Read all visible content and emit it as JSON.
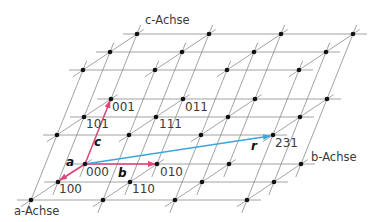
{
  "diagram": {
    "type": "crystal-lattice",
    "axes": {
      "a_label": "a-Achse",
      "b_label": "b-Achse",
      "c_label": "c-Achse"
    },
    "vectors": {
      "a": "a",
      "b": "b",
      "c": "c",
      "r": "r"
    },
    "point_labels": [
      {
        "id": "p001",
        "text": "001"
      },
      {
        "id": "p011",
        "text": "011"
      },
      {
        "id": "p101",
        "text": "101"
      },
      {
        "id": "p111",
        "text": "111"
      },
      {
        "id": "p000",
        "text": "000"
      },
      {
        "id": "p010",
        "text": "010"
      },
      {
        "id": "p100",
        "text": "100"
      },
      {
        "id": "p110",
        "text": "110"
      },
      {
        "id": "p231",
        "text": "231"
      }
    ],
    "colors": {
      "grid": "#8a8a8a",
      "point": "#111111",
      "basis_vector": "#e0457b",
      "position_vector": "#3aa6dd",
      "text": "#3a3a3a"
    },
    "lattice": {
      "origin": [
        85,
        164
      ],
      "a_step": [
        -27,
        18
      ],
      "b_step": [
        72,
        0
      ],
      "c_step": [
        26,
        -65
      ],
      "i_range": [
        0,
        2
      ],
      "j_range": [
        0,
        3
      ],
      "k_range": [
        0,
        2
      ]
    }
  }
}
